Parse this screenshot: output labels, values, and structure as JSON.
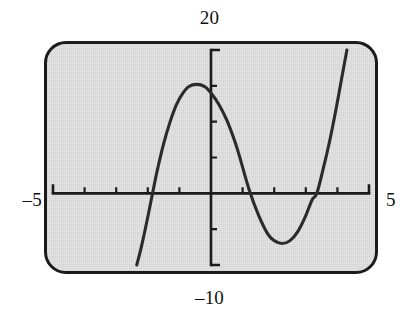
{
  "figure": {
    "kind": "graphing-calculator-screen"
  },
  "window_labels": {
    "y_max": "20",
    "y_min": "–10",
    "x_min": "–5",
    "x_max": "5"
  },
  "colors": {
    "screen_background": "#e6e6e6",
    "bezel": "#1b1b1b",
    "axis": "#1b1b1b",
    "curve": "#2b2b2b",
    "page_background": "#ffffff"
  },
  "chart_data": {
    "type": "line",
    "title": "",
    "xlabel": "",
    "ylabel": "",
    "xlim": [
      -5,
      5
    ],
    "ylim": [
      -10,
      20
    ],
    "grid": false,
    "legend": null,
    "x_tick_step": 1,
    "y_tick_step": 5,
    "x_ticks": [
      -4,
      -3,
      -2,
      -1,
      1,
      2,
      3,
      4
    ],
    "y_ticks": [
      -5,
      5,
      10,
      15
    ],
    "axis_tick_length_px": 6,
    "features": {
      "local_max": {
        "x": -0.45,
        "y": 15.2
      },
      "local_min": {
        "x": 2.25,
        "y": -7.0
      },
      "x_intercepts": [
        -1.85,
        0.9,
        3.35
      ],
      "y_intercept": 14.0
    },
    "series": [
      {
        "name": "curve",
        "clipped_to_window": true,
        "x": [
          -2.35,
          -2.2,
          -2.0,
          -1.85,
          -1.7,
          -1.5,
          -1.3,
          -1.1,
          -0.9,
          -0.7,
          -0.45,
          -0.2,
          0.0,
          0.25,
          0.5,
          0.75,
          0.9,
          1.2,
          1.5,
          1.8,
          2.0,
          2.25,
          2.5,
          2.75,
          3.0,
          3.2,
          3.35,
          3.55,
          3.75,
          3.95,
          4.15,
          4.3
        ],
        "y": [
          -10.0,
          -7.4,
          -3.3,
          0.0,
          3.2,
          6.9,
          9.9,
          12.3,
          13.9,
          14.9,
          15.2,
          14.9,
          14.0,
          12.4,
          10.2,
          7.3,
          5.2,
          0.6,
          -3.0,
          -5.7,
          -6.6,
          -7.0,
          -6.6,
          -5.3,
          -3.1,
          -0.9,
          0.0,
          3.4,
          7.2,
          11.6,
          16.4,
          20.0
        ]
      }
    ]
  }
}
